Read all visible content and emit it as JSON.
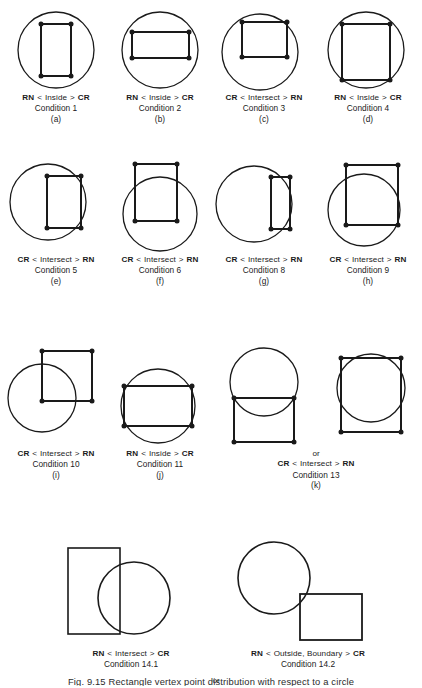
{
  "figure": {
    "caption_number": "Fig. 9.15",
    "caption_text": "Rectangle vertex point distribution with respect to a circle",
    "stroke_color": "#1a1a1a",
    "vertex_color": "#1a1a1a",
    "background_color": "#ffffff"
  },
  "legend_tokens": {
    "rn": "RN",
    "cr": "CR",
    "less_than": "<",
    "greater_than": ">",
    "inside": "Inside",
    "intersect": "Intersect",
    "outside_boundary": "Outside, Boundary",
    "or": "or"
  },
  "panels": [
    {
      "id": "a",
      "letter": "(a)",
      "condition": "Condition 1",
      "left_code": "RN",
      "relation": "Inside",
      "right_code": "CR",
      "vertices_shown": true
    },
    {
      "id": "b",
      "letter": "(b)",
      "condition": "Condition 2",
      "left_code": "RN",
      "relation": "Inside",
      "right_code": "CR",
      "vertices_shown": true
    },
    {
      "id": "c",
      "letter": "(c)",
      "condition": "Condition 3",
      "left_code": "CR",
      "relation": "Intersect",
      "right_code": "RN",
      "vertices_shown": true
    },
    {
      "id": "d",
      "letter": "(d)",
      "condition": "Condition 4",
      "left_code": "RN",
      "relation": "Inside",
      "right_code": "CR",
      "vertices_shown": true
    },
    {
      "id": "e",
      "letter": "(e)",
      "condition": "Condition 5",
      "left_code": "CR",
      "relation": "Intersect",
      "right_code": "RN",
      "vertices_shown": true
    },
    {
      "id": "f",
      "letter": "(f)",
      "condition": "Condition 6",
      "left_code": "CR",
      "relation": "Intersect",
      "right_code": "RN",
      "vertices_shown": true
    },
    {
      "id": "g",
      "letter": "(g)",
      "condition": "Condition 8",
      "left_code": "CR",
      "relation": "Intersect",
      "right_code": "RN",
      "vertices_shown": true
    },
    {
      "id": "h",
      "letter": "(h)",
      "condition": "Condition 9",
      "left_code": "CR",
      "relation": "Intersect",
      "right_code": "RN",
      "vertices_shown": true
    },
    {
      "id": "i",
      "letter": "(i)",
      "condition": "Condition 10",
      "left_code": "CR",
      "relation": "Intersect",
      "right_code": "RN",
      "vertices_shown": true
    },
    {
      "id": "j",
      "letter": "(j)",
      "condition": "Condition 11",
      "left_code": "RN",
      "relation": "Inside",
      "right_code": "CR",
      "vertices_shown": true
    },
    {
      "id": "k",
      "letter": "(k)",
      "condition": "Condition 13",
      "left_code": "CR",
      "relation": "Intersect",
      "right_code": "RN",
      "or_label": "or",
      "vertices_shown": true
    },
    {
      "id": "l14a",
      "letter": "",
      "condition": "Condition 14.1",
      "left_code": "RN",
      "relation": "Intersect",
      "right_code": "CR",
      "or_label": "or",
      "vertices_shown": false
    },
    {
      "id": "l14b",
      "letter": "",
      "condition": "Condition 14.2",
      "left_code": "RN",
      "relation": "Outside, Boundary",
      "right_code": "CR",
      "vertices_shown": false
    }
  ],
  "geometry": {
    "a": {
      "circle": {
        "cx": 50,
        "cy": 46,
        "r": 38
      },
      "rect": {
        "x": 35,
        "y": 20,
        "w": 30,
        "h": 52
      }
    },
    "b": {
      "circle": {
        "cx": 50,
        "cy": 46,
        "r": 38
      },
      "rect": {
        "x": 22,
        "y": 28,
        "w": 57,
        "h": 26
      }
    },
    "c": {
      "circle": {
        "cx": 46,
        "cy": 48,
        "r": 38
      },
      "rect": {
        "x": 28,
        "y": 18,
        "w": 45,
        "h": 35
      }
    },
    "d": {
      "circle": {
        "cx": 48,
        "cy": 46,
        "r": 38
      },
      "rect": {
        "x": 24,
        "y": 20,
        "w": 48,
        "h": 56
      }
    },
    "e": {
      "circle": {
        "cx": 42,
        "cy": 50,
        "r": 38
      },
      "rect": {
        "x": 41,
        "y": 24,
        "w": 34,
        "h": 52
      }
    },
    "f": {
      "circle": {
        "cx": 50,
        "cy": 62,
        "r": 37
      },
      "rect": {
        "x": 25,
        "y": 12,
        "w": 42,
        "h": 57
      }
    },
    "g": {
      "circle": {
        "cx": 40,
        "cy": 52,
        "r": 38
      },
      "rect": {
        "x": 57,
        "y": 25,
        "w": 19,
        "h": 52
      }
    },
    "h": {
      "circle": {
        "cx": 46,
        "cy": 58,
        "r": 36
      },
      "rect": {
        "x": 28,
        "y": 13,
        "w": 52,
        "h": 60
      }
    },
    "i": {
      "circle": {
        "cx": 36,
        "cy": 60,
        "r": 34
      },
      "rect": {
        "x": 36,
        "y": 13,
        "w": 50,
        "h": 50
      }
    },
    "j": {
      "circle": {
        "cx": 48,
        "cy": 46,
        "r": 37
      },
      "rect": {
        "x": 14,
        "y": 26,
        "w": 68,
        "h": 40
      }
    },
    "k1": {
      "circle": {
        "cx": 46,
        "cy": 40,
        "r": 34
      },
      "rect": {
        "x": 16,
        "y": 56,
        "w": 60,
        "h": 44
      }
    },
    "k2": {
      "circle": {
        "cx": 47,
        "cy": 46,
        "r": 34
      },
      "rect": {
        "x": 17,
        "y": 16,
        "w": 60,
        "h": 74
      }
    },
    "l14a": {
      "circle": {
        "cx": 78,
        "cy": 62,
        "r": 36
      },
      "rect": {
        "x": 12,
        "y": 12,
        "w": 52,
        "h": 86
      }
    },
    "l14b": {
      "circle": {
        "cx": 46,
        "cy": 42,
        "r": 36
      },
      "rect": {
        "x": 72,
        "y": 58,
        "w": 62,
        "h": 46
      }
    }
  }
}
